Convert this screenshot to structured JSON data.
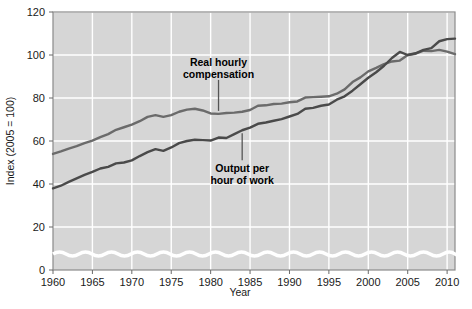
{
  "chart_data": {
    "type": "line",
    "title": "",
    "xlabel": "Year",
    "ylabel": "Index (2005 = 100)",
    "xlim": [
      1960,
      2011
    ],
    "ylim": [
      0,
      120
    ],
    "grid": true,
    "axis_break": true,
    "legend": "annotations",
    "xticks": [
      1960,
      1965,
      1970,
      1975,
      1980,
      1985,
      1990,
      1995,
      2000,
      2005,
      2010
    ],
    "xtick_labels": [
      "1960",
      "1965",
      "1970",
      "1975",
      "1980",
      "1985",
      "1990",
      "1995",
      "2000",
      "2005",
      "2010"
    ],
    "yticks": [
      0,
      20,
      40,
      60,
      80,
      100,
      120
    ],
    "ytick_labels": [
      "0",
      "20",
      "40",
      "60",
      "80",
      "100",
      "120"
    ],
    "plot_bg": "#d6d6d6",
    "grid_color": "#ffffff",
    "series": [
      {
        "name": "Real hourly compensation",
        "color": "#6b6b6b",
        "x": [
          1960,
          1961,
          1962,
          1963,
          1964,
          1965,
          1966,
          1967,
          1968,
          1969,
          1970,
          1971,
          1972,
          1973,
          1974,
          1975,
          1976,
          1977,
          1978,
          1979,
          1980,
          1981,
          1982,
          1983,
          1984,
          1985,
          1986,
          1987,
          1988,
          1989,
          1990,
          1991,
          1992,
          1993,
          1994,
          1995,
          1996,
          1997,
          1998,
          1999,
          2000,
          2001,
          2002,
          2003,
          2004,
          2005,
          2006,
          2007,
          2008,
          2009,
          2010,
          2011
        ],
        "values": [
          54.0,
          55.2,
          56.5,
          57.6,
          59.0,
          60.2,
          61.8,
          63.2,
          65.2,
          66.4,
          67.6,
          69.2,
          71.2,
          72.0,
          71.2,
          72.0,
          73.6,
          74.6,
          75.0,
          74.2,
          72.8,
          72.6,
          73.0,
          73.2,
          73.6,
          74.4,
          76.4,
          76.6,
          77.2,
          77.4,
          78.0,
          78.4,
          80.2,
          80.4,
          80.6,
          80.8,
          82.0,
          84.0,
          87.4,
          89.6,
          92.4,
          94.0,
          95.8,
          97.0,
          97.4,
          100.0,
          100.6,
          102.0,
          101.8,
          102.4,
          101.6,
          100.4
        ]
      },
      {
        "name": "Output per hour of work",
        "color": "#4a4a4a",
        "x": [
          1960,
          1961,
          1962,
          1963,
          1964,
          1965,
          1966,
          1967,
          1968,
          1969,
          1970,
          1971,
          1972,
          1973,
          1974,
          1975,
          1976,
          1977,
          1978,
          1979,
          1980,
          1981,
          1982,
          1983,
          1984,
          1985,
          1986,
          1987,
          1988,
          1989,
          1990,
          1991,
          1992,
          1993,
          1994,
          1995,
          1996,
          1997,
          1998,
          1999,
          2000,
          2001,
          2002,
          2003,
          2004,
          2005,
          2006,
          2007,
          2008,
          2009,
          2010,
          2011
        ],
        "values": [
          38.0,
          39.2,
          41.0,
          42.6,
          44.2,
          45.6,
          47.2,
          48.0,
          49.6,
          50.0,
          51.0,
          53.0,
          54.8,
          56.2,
          55.4,
          57.0,
          59.0,
          60.0,
          60.6,
          60.4,
          60.2,
          61.6,
          61.4,
          63.2,
          65.0,
          66.2,
          68.0,
          68.6,
          69.4,
          70.2,
          71.4,
          72.6,
          75.0,
          75.4,
          76.4,
          77.0,
          79.2,
          80.8,
          83.4,
          86.4,
          89.4,
          92.0,
          95.0,
          98.6,
          101.4,
          100.0,
          100.8,
          102.4,
          103.2,
          106.4,
          107.4,
          107.6
        ]
      }
    ],
    "annotations": [
      {
        "text_line1": "Real hourly",
        "text_line2": "compensation",
        "target_series": "Real hourly compensation",
        "target_year": 1981
      },
      {
        "text_line1": "Output per",
        "text_line2": "hour of work",
        "target_series": "Output per hour of work",
        "target_year": 1984
      }
    ]
  }
}
